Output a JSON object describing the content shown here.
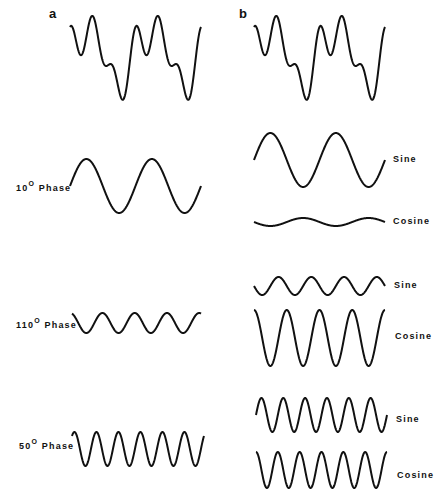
{
  "panels": {
    "a": {
      "label": "a"
    },
    "b": {
      "label": "b"
    }
  },
  "labels": {
    "phase10": {
      "num": "10",
      "deg": "O",
      "text": "Phase"
    },
    "phase110": {
      "num": "110",
      "deg": "O",
      "text": "Phase"
    },
    "phase50": {
      "num": "50",
      "deg": "O",
      "text": "Phase"
    },
    "sine": "Sine",
    "cosine": "Cosine"
  },
  "stroke_color": "#111111",
  "waves": [
    {
      "id": "a-composite",
      "x0": 70,
      "x1": 201,
      "type": "composite",
      "cy": 54,
      "periods": 2
    },
    {
      "id": "b-composite",
      "x0": 254,
      "x1": 385,
      "type": "composite",
      "cy": 54,
      "periods": 2
    },
    {
      "id": "a-10deg",
      "x0": 70,
      "x1": 201,
      "cy": 186,
      "amp": 27,
      "periods": 2,
      "phase": 0
    },
    {
      "id": "b-sine-1",
      "x0": 254,
      "x1": 385,
      "cy": 160,
      "amp": 27,
      "periods": 2,
      "phase": 0
    },
    {
      "id": "b-cosine-1",
      "x0": 254,
      "x1": 385,
      "cy": 222,
      "amp": 4,
      "periods": 2,
      "phase": 180
    },
    {
      "id": "a-110deg",
      "x0": 72,
      "x1": 201,
      "cy": 323,
      "amp": 10,
      "periods": 4,
      "phase": 110
    },
    {
      "id": "b-sine-2",
      "x0": 254,
      "x1": 385,
      "cy": 286,
      "amp": 9,
      "periods": 4,
      "phase": 180
    },
    {
      "id": "b-cosine-2",
      "x0": 254,
      "x1": 385,
      "cy": 338,
      "amp": 28,
      "periods": 4,
      "phase": 90
    },
    {
      "id": "a-50deg",
      "x0": 72,
      "x1": 204,
      "cy": 449,
      "amp": 17,
      "periods": 6,
      "phase": 50
    },
    {
      "id": "b-sine-3",
      "x0": 256,
      "x1": 387,
      "cy": 415,
      "amp": 17,
      "periods": 6,
      "phase": 0
    },
    {
      "id": "b-cosine-3",
      "x0": 256,
      "x1": 387,
      "cy": 470,
      "amp": 18,
      "periods": 6,
      "phase": 90
    }
  ]
}
